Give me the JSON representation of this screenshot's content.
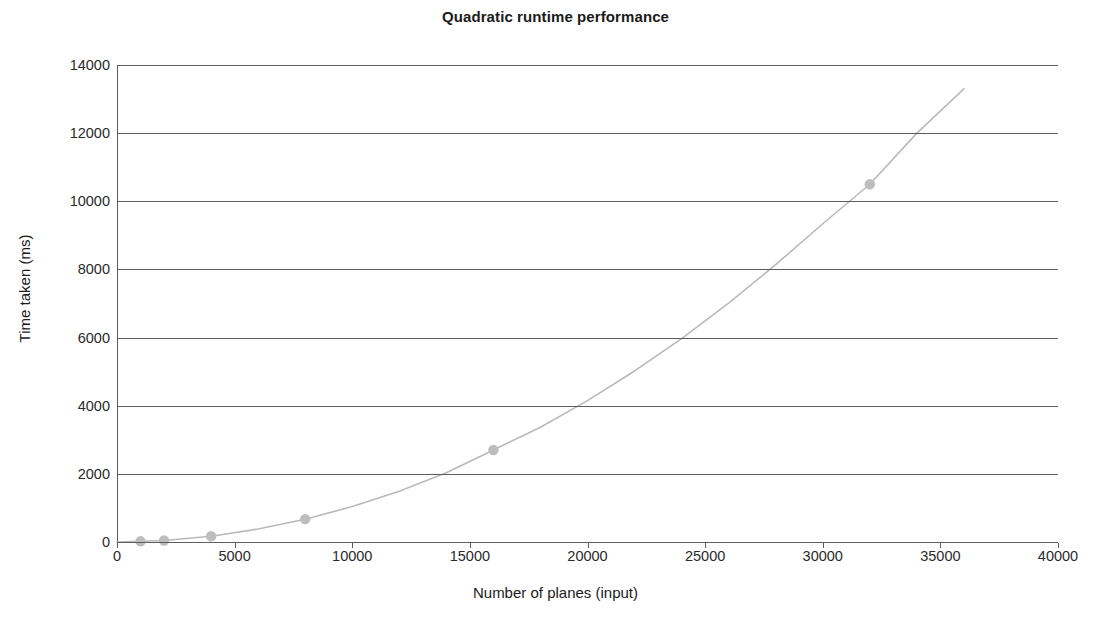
{
  "chart_data": {
    "type": "line",
    "title": "Quadratic runtime performance",
    "xlabel": "Number of planes (input)",
    "ylabel": "Time taken (ms)",
    "xlim": [
      0,
      40000
    ],
    "ylim": [
      0,
      14000
    ],
    "grid": true,
    "grid_axis": "y",
    "legend": null,
    "legend_position": "none",
    "xticks": [
      0,
      5000,
      10000,
      15000,
      20000,
      25000,
      30000,
      35000,
      40000
    ],
    "xtick_labels": [
      "0",
      "5000",
      "10000",
      "15000",
      "20000",
      "25000",
      "30000",
      "35000",
      "40000"
    ],
    "yticks": [
      0,
      2000,
      4000,
      6000,
      8000,
      10000,
      12000,
      14000
    ],
    "ytick_labels": [
      "0",
      "2000",
      "4000",
      "6000",
      "8000",
      "10000",
      "12000",
      "14000"
    ],
    "series": [
      {
        "name": "Quadratic runtime",
        "line_color": "#b9b9b9",
        "marker": "circle",
        "marker_color": "#bdbdbd",
        "markers_x": [
          1000,
          2000,
          4000,
          8000,
          16000,
          32000
        ],
        "markers_y": [
          20,
          45,
          170,
          670,
          2700,
          10500
        ],
        "x": [
          0,
          1000,
          2000,
          4000,
          6000,
          8000,
          10000,
          12000,
          14000,
          16000,
          18000,
          20000,
          22000,
          24000,
          26000,
          28000,
          30000,
          32000,
          34000,
          36000
        ],
        "y": [
          0,
          20,
          45,
          170,
          380,
          670,
          1040,
          1490,
          2030,
          2700,
          3370,
          4150,
          5020,
          5970,
          7010,
          8140,
          9340,
          10500,
          12000,
          13300
        ]
      }
    ],
    "annotations": []
  },
  "colors": {
    "axis": "#5d5d5d",
    "text": "#1b1b1b",
    "series": "#b9b9b9",
    "background": "#ffffff"
  }
}
